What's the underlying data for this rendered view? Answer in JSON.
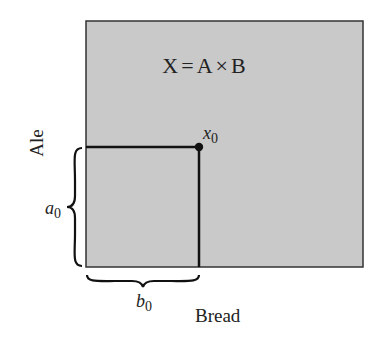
{
  "diagram": {
    "region_label": "X = A × B",
    "region_label_parts": {
      "lhs": "X",
      "eq": "=",
      "a": "A",
      "times": "×",
      "b": "B"
    },
    "y_axis_label": "Ale",
    "x_axis_label": "Bread",
    "point": {
      "name": "x",
      "subscript": "0"
    },
    "brace_vertical_label": {
      "name": "a",
      "subscript": "0"
    },
    "brace_horizontal_label": {
      "name": "b",
      "subscript": "0"
    },
    "colors": {
      "region_fill": "#c9c9c9",
      "stroke": "#222222",
      "text": "#222222",
      "background": "#ffffff"
    }
  }
}
